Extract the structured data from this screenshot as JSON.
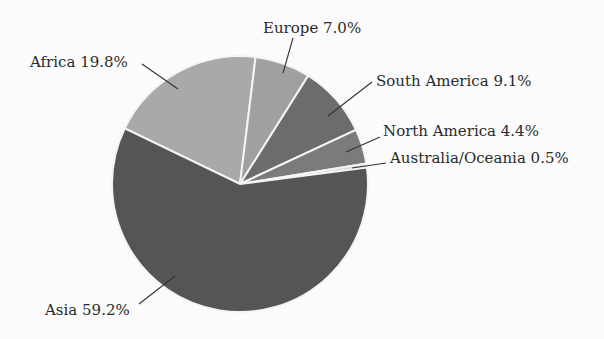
{
  "chart_data": {
    "type": "pie",
    "title": "",
    "categories": [
      "Africa",
      "Europe",
      "South America",
      "North America",
      "Australia/Oceania",
      "Asia"
    ],
    "values": [
      19.8,
      7.0,
      9.1,
      4.4,
      0.5,
      59.2
    ],
    "unit": "%",
    "labels": [
      "Africa 19.8%",
      "Europe 7.0%",
      "South America 9.1%",
      "North America 4.4%",
      "Australia/Oceania 0.5%",
      "Asia 59.2%"
    ],
    "colors": [
      "#a9a9a9",
      "#a0a0a0",
      "#6c6c6c",
      "#7b7b7b",
      "#d6d6d6",
      "#555555"
    ],
    "start_angle_deg": -71.3,
    "direction": "clockwise",
    "legend": "none (direct labels with leader lines)"
  },
  "layout": {
    "center": [
      240,
      184
    ],
    "radius": 128,
    "label_positions": [
      {
        "x": 30,
        "y": 67,
        "anchor": "start",
        "line": [
          142,
          64,
          178,
          89
        ]
      },
      {
        "x": 263,
        "y": 33,
        "anchor": "start",
        "line": [
          293,
          38,
          283,
          73
        ]
      },
      {
        "x": 376,
        "y": 86,
        "anchor": "start",
        "line": [
          372,
          82,
          328,
          116
        ]
      },
      {
        "x": 383,
        "y": 136,
        "anchor": "start",
        "line": [
          380,
          137,
          346,
          152
        ]
      },
      {
        "x": 390,
        "y": 163,
        "anchor": "start",
        "line": [
          386,
          163,
          352,
          168
        ]
      },
      {
        "x": 45,
        "y": 315,
        "anchor": "start",
        "line": [
          139,
          304,
          175,
          276
        ]
      }
    ]
  }
}
